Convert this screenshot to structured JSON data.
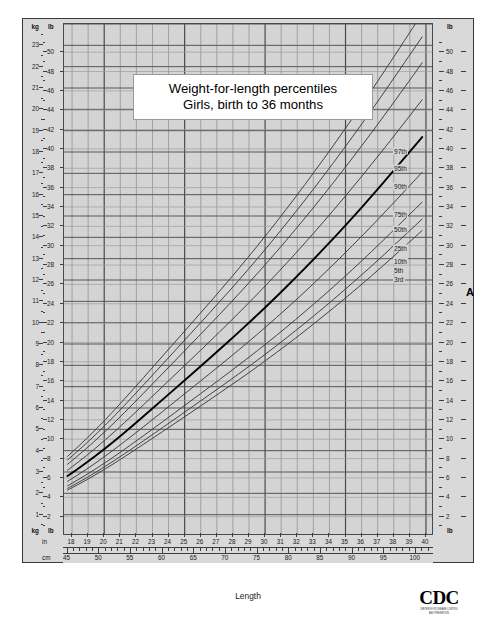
{
  "chart_data": {
    "type": "line",
    "title_line1": "Weight-for-length percentiles",
    "title_line2": "Girls, birth to 36 months",
    "xlabel": "Length",
    "ylabel": "",
    "figure_letter": "A",
    "grid": true,
    "legend_position": "right",
    "x_axis": {
      "primary_unit": "in",
      "secondary_unit": "cm",
      "in_min": 17.5,
      "in_max": 40.5,
      "in_ticks": [
        18,
        19,
        20,
        21,
        22,
        23,
        24,
        25,
        26,
        27,
        28,
        29,
        30,
        31,
        32,
        33,
        34,
        35,
        36,
        37,
        38,
        39,
        40
      ],
      "cm_min": 44.45,
      "cm_max": 102.87,
      "cm_labeled_ticks": [
        45,
        50,
        55,
        60,
        65,
        70,
        75,
        80,
        85,
        90,
        95,
        100
      ]
    },
    "y_axis": {
      "primary_unit": "kg",
      "secondary_unit": "lb",
      "kg_min": 0,
      "kg_max": 24,
      "kg_ticks": [
        1,
        2,
        3,
        4,
        5,
        6,
        7,
        8,
        9,
        10,
        11,
        12,
        13,
        14,
        15,
        16,
        17,
        18,
        19,
        20,
        21,
        22,
        23
      ],
      "lb_min": 0,
      "lb_max": 52.9,
      "lb_ticks": [
        2,
        4,
        6,
        8,
        10,
        12,
        14,
        16,
        18,
        20,
        22,
        24,
        26,
        28,
        30,
        32,
        34,
        36,
        38,
        40,
        42,
        44,
        46,
        48,
        50
      ],
      "lb_right_ticks": [
        2,
        4,
        6,
        8,
        10,
        12,
        14,
        16,
        18,
        20,
        22,
        24,
        26,
        28,
        30,
        32,
        34,
        36,
        38,
        40,
        42,
        44,
        46,
        48,
        50
      ]
    },
    "curve_x_cm": [
      45,
      48,
      51,
      54,
      57,
      60,
      63,
      66,
      69,
      72,
      75,
      78,
      81,
      84,
      87,
      90,
      93,
      96,
      99,
      101
    ],
    "series": [
      {
        "name": "97th",
        "label": "97th",
        "bold": false,
        "values_kg": [
          3.73,
          4.55,
          5.45,
          6.42,
          7.42,
          8.43,
          9.44,
          10.45,
          11.47,
          12.52,
          13.6,
          14.72,
          15.88,
          17.08,
          18.31,
          19.58,
          20.88,
          22.22,
          23.58,
          24.5
        ]
      },
      {
        "name": "95th",
        "label": "95th",
        "bold": false,
        "values_kg": [
          3.56,
          4.34,
          5.2,
          6.12,
          7.08,
          8.05,
          9.02,
          9.99,
          10.97,
          11.97,
          13.0,
          14.07,
          15.18,
          16.32,
          17.5,
          18.71,
          19.95,
          21.23,
          22.53,
          23.4
        ]
      },
      {
        "name": "90th",
        "label": "90th",
        "bold": false,
        "values_kg": [
          3.36,
          4.1,
          4.91,
          5.78,
          6.69,
          7.61,
          8.53,
          9.45,
          10.38,
          11.33,
          12.31,
          13.32,
          14.37,
          15.45,
          16.57,
          17.72,
          18.9,
          20.11,
          21.35,
          22.18
        ]
      },
      {
        "name": "75th",
        "label": "75th",
        "bold": false,
        "values_kg": [
          3.08,
          3.76,
          4.51,
          5.31,
          6.15,
          7.0,
          7.85,
          8.7,
          9.56,
          10.44,
          11.34,
          12.28,
          13.24,
          14.24,
          15.27,
          16.33,
          17.42,
          18.54,
          19.68,
          20.45
        ]
      },
      {
        "name": "50th",
        "label": "50th",
        "bold": true,
        "values_kg": [
          2.81,
          3.43,
          4.11,
          4.84,
          5.61,
          6.39,
          7.17,
          7.95,
          8.74,
          9.54,
          10.37,
          11.22,
          12.1,
          13.01,
          13.95,
          14.92,
          15.92,
          16.95,
          18.0,
          18.7
        ]
      },
      {
        "name": "25th",
        "label": "25th",
        "bold": false,
        "values_kg": [
          2.56,
          3.12,
          3.75,
          4.42,
          5.12,
          5.83,
          6.55,
          7.26,
          7.98,
          8.71,
          9.46,
          10.24,
          11.04,
          11.87,
          12.73,
          13.61,
          14.52,
          15.46,
          16.41,
          17.05
        ]
      },
      {
        "name": "10th",
        "label": "10th",
        "bold": false,
        "values_kg": [
          2.35,
          2.87,
          3.44,
          4.06,
          4.7,
          5.35,
          6.01,
          6.67,
          7.33,
          8.0,
          8.69,
          9.4,
          10.14,
          10.9,
          11.68,
          12.49,
          13.33,
          14.19,
          15.07,
          15.65
        ]
      },
      {
        "name": "5th",
        "label": "5th",
        "bold": false,
        "values_kg": [
          2.23,
          2.72,
          3.27,
          3.85,
          4.46,
          5.08,
          5.7,
          6.33,
          6.95,
          7.59,
          8.24,
          8.92,
          9.62,
          10.34,
          11.09,
          11.86,
          12.65,
          13.47,
          14.3,
          14.86
        ]
      },
      {
        "name": "3rd",
        "label": "3rd",
        "bold": false,
        "values_kg": [
          2.15,
          2.62,
          3.15,
          3.71,
          4.3,
          4.89,
          5.49,
          6.09,
          6.7,
          7.31,
          7.94,
          8.6,
          9.27,
          9.97,
          10.69,
          11.43,
          12.19,
          12.98,
          13.78,
          14.32
        ]
      }
    ],
    "colors": {
      "plot_background": "#d4d4d4",
      "frame_background": "#d9d9d9",
      "grid_minor": "#9a9a9a",
      "grid_major": "#4a4a4a",
      "curve": "#3a3a3a",
      "curve_bold": "#000000",
      "page_background": "#ffffff"
    }
  },
  "axis_units": {
    "kg_head": "kg",
    "lb_head": "lb",
    "lb_head_right": "lb",
    "kg_foot": "kg",
    "lb_foot": "lb",
    "in_head": "in",
    "cm_head": "cm"
  },
  "logo": {
    "wordmark": "CDC",
    "tagline_line1": "CENTERS FOR DISEASE CONTROL",
    "tagline_line2": "AND PREVENTION"
  }
}
